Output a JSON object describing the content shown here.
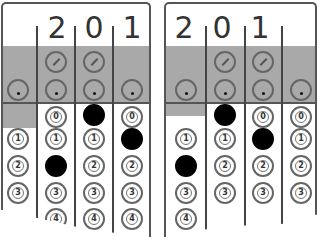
{
  "panels": [
    {
      "id": "left",
      "header_digits": [
        "",
        "2",
        "0",
        "1"
      ],
      "columns": 4,
      "slash_row_columns": [
        1,
        2
      ],
      "dot_row_columns": [
        0,
        1,
        2,
        3
      ],
      "filled": {
        "col1": "2",
        "col2": "0",
        "col3": "1"
      },
      "bubble_labels": [
        "0",
        "1",
        "2",
        "3",
        "4"
      ]
    },
    {
      "id": "right",
      "header_digits": [
        "2",
        "0",
        "1",
        ""
      ],
      "columns": 4,
      "slash_row_columns": [
        1,
        2
      ],
      "dot_row_columns": [
        0,
        1,
        2,
        3
      ],
      "filled": {
        "col0": "2",
        "col1": "0",
        "col2": "1"
      },
      "bubble_labels": [
        "0",
        "1",
        "2",
        "3",
        "4"
      ]
    }
  ],
  "labels": {
    "d0": "0",
    "d1": "1",
    "d2": "2",
    "d3": "3",
    "d4": "4",
    "left_h1": "2",
    "left_h2": "0",
    "left_h3": "1",
    "right_h0": "2",
    "right_h1": "0",
    "right_h2": "1"
  },
  "colors": {
    "grey_band": "#a9a9a9",
    "border": "#555555",
    "filled_bubble": "#000000"
  }
}
